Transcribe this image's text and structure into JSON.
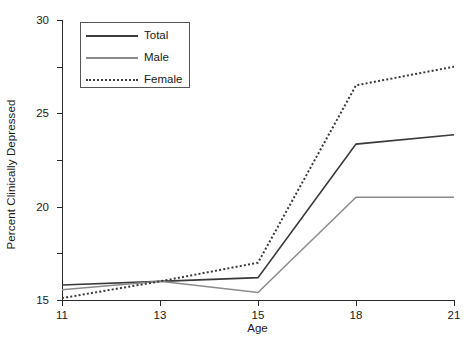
{
  "chart_data": {
    "type": "line",
    "title": "",
    "xlabel": "Age",
    "ylabel": "Percent Clinically Depressed",
    "categories": [
      "11",
      "13",
      "15",
      "18",
      "21"
    ],
    "x_tick_labels": [
      "11",
      "13",
      "15",
      "18",
      "21"
    ],
    "y_tick_labels": [
      "0",
      "5",
      "10",
      "15",
      "20",
      "25",
      "30"
    ],
    "y_ticks": [
      0,
      5,
      10,
      15,
      20,
      25,
      30
    ],
    "ylim": [
      0,
      30
    ],
    "grid": false,
    "legend_position": "upper-left-inside",
    "series": [
      {
        "name": "Total",
        "values": [
          1.6,
          2.0,
          2.4,
          16.7,
          17.7
        ],
        "color": "#3a3a3a",
        "style": "solid",
        "width": 1.6
      },
      {
        "name": "Male",
        "values": [
          1.1,
          2.0,
          0.8,
          11.0,
          11.0
        ],
        "color": "#8a8a8a",
        "style": "solid",
        "width": 1.5
      },
      {
        "name": "Female",
        "values": [
          0.2,
          2.0,
          4.0,
          23.0,
          25.0
        ],
        "color": "#3a3a3a",
        "style": "dotted",
        "width": 2.0
      }
    ]
  },
  "axes": {
    "x_title": "Age",
    "y_title": "Percent Clinically Depressed"
  },
  "legend": {
    "entries": [
      {
        "label": "Total"
      },
      {
        "label": "Male"
      },
      {
        "label": "Female"
      }
    ]
  }
}
